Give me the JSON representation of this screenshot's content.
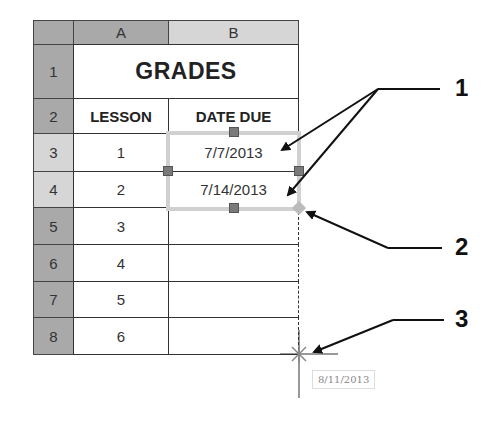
{
  "spreadsheet": {
    "corner": "",
    "columns": [
      {
        "label": "A",
        "selected": false
      },
      {
        "label": "B",
        "selected": true
      }
    ],
    "rows": [
      {
        "num": "1",
        "selected": false
      },
      {
        "num": "2",
        "selected": false
      },
      {
        "num": "3",
        "selected": true
      },
      {
        "num": "4",
        "selected": true
      },
      {
        "num": "5",
        "selected": false
      },
      {
        "num": "6",
        "selected": false
      },
      {
        "num": "7",
        "selected": false
      },
      {
        "num": "8",
        "selected": false
      }
    ],
    "title": "GRADES",
    "headers": {
      "lesson": "LESSON",
      "date_due": "DATE DUE"
    },
    "data": [
      {
        "lesson": "1",
        "date": "7/7/2013"
      },
      {
        "lesson": "2",
        "date": "7/14/2013"
      },
      {
        "lesson": "3",
        "date": ""
      },
      {
        "lesson": "4",
        "date": ""
      },
      {
        "lesson": "5",
        "date": ""
      },
      {
        "lesson": "6",
        "date": ""
      }
    ]
  },
  "fill_tooltip": "8/11/2013",
  "callouts": [
    "1",
    "2",
    "3"
  ]
}
